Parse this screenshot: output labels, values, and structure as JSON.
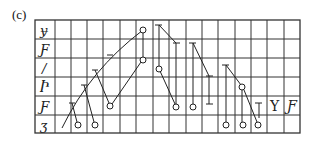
{
  "figure": {
    "panel_label": "(c)",
    "row_glyphs": [
      "ɏ",
      "Ƒ",
      "/",
      "Ⴡ",
      "Ƒ",
      "ʒ"
    ],
    "extra_glyphs": [
      "Y",
      "Ƒ"
    ],
    "colors": {
      "line": "#222222",
      "background": "#ffffff"
    }
  },
  "grid": {
    "rows": 6,
    "columns": 16,
    "label_column": true
  }
}
